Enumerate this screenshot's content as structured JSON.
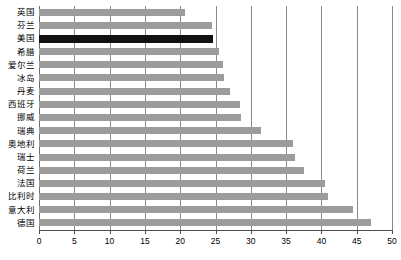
{
  "chart_data": {
    "type": "bar",
    "orientation": "horizontal",
    "title": "",
    "xlabel": "",
    "ylabel": "",
    "xlim": [
      0,
      50
    ],
    "xticks": [
      0,
      5,
      10,
      15,
      20,
      25,
      30,
      35,
      40,
      45,
      50
    ],
    "grid": true,
    "legend": null,
    "categories": [
      "英国",
      "芬兰",
      "美国",
      "希腊",
      "爱尔兰",
      "冰岛",
      "丹麦",
      "西班牙",
      "挪威",
      "瑞典",
      "奥地利",
      "瑞士",
      "荷兰",
      "法国",
      "比利时",
      "意大利",
      "德国"
    ],
    "values": [
      20.7,
      24.5,
      24.6,
      25.5,
      26.0,
      26.2,
      27.0,
      28.5,
      28.6,
      31.5,
      36.0,
      36.2,
      37.5,
      40.5,
      41.0,
      44.5,
      47.0
    ],
    "highlight_category": "美国",
    "colors": {
      "bar": "#9c9c9c",
      "bar_highlight": "#111111",
      "gridline": "#8a8a8a",
      "axis": "#4d4d4d",
      "background": "#ffffff",
      "text": "#000000"
    }
  }
}
